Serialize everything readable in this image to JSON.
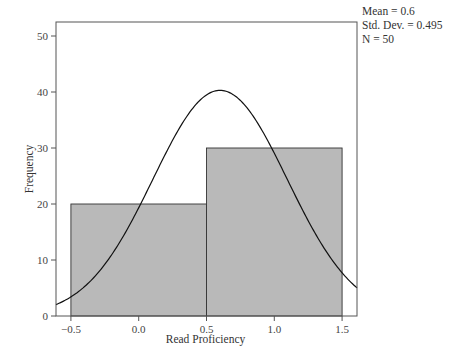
{
  "chart_data": {
    "type": "bar",
    "subtype": "histogram",
    "title": "",
    "xlabel": "Read Proficiency",
    "ylabel": "Frequency",
    "bins": [
      {
        "from": -0.5,
        "to": 0.5,
        "count": 20
      },
      {
        "from": 0.5,
        "to": 1.5,
        "count": 30
      }
    ],
    "categories": [
      "-0.5 to 0.5",
      "0.5 to 1.5"
    ],
    "values": [
      20,
      30
    ],
    "x_ticks": [
      "-0.5",
      "0.0",
      "0.5",
      "1.0",
      "1.5"
    ],
    "y_ticks": [
      "0",
      "10",
      "20",
      "30",
      "40",
      "50"
    ],
    "xlim": [
      -0.61,
      1.61
    ],
    "ylim": [
      0,
      52.5
    ],
    "normal_curve": {
      "mean": 0.6,
      "std": 0.495,
      "n": 50,
      "bin_width": 1.0
    },
    "grid": false,
    "legend": null,
    "annotations": [
      "Mean = 0.6",
      "Std. Dev. = 0.495",
      "N = 50"
    ],
    "colors": {
      "bar_fill": "#b9b9b9",
      "bar_edge": "#333333",
      "curve": "#111111",
      "frame": "#555555"
    }
  },
  "stats": {
    "mean": "Mean = 0.6",
    "std": "Std. Dev. = 0.495",
    "n": "N = 50"
  }
}
